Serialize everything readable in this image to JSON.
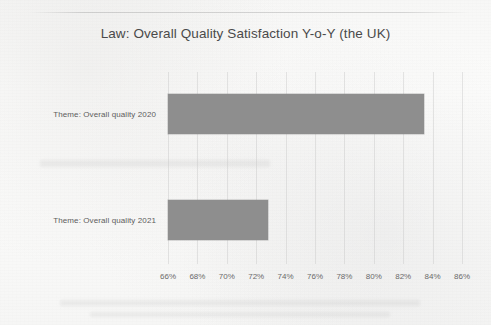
{
  "document": {
    "medium": "scanned-page",
    "background_color": "#fbfbfa"
  },
  "chart_data": {
    "type": "bar",
    "orientation": "horizontal",
    "title": "Law: Overall Quality Satisfaction Y-o-Y (the UK)",
    "xlabel": "",
    "ylabel": "",
    "categories": [
      "Theme: Overall quality 2020",
      "Theme: Overall quality 2021"
    ],
    "values": [
      83.4,
      72.8
    ],
    "value_unit": "%",
    "xlim": [
      66,
      86
    ],
    "xtick_labels": [
      "66%",
      "68%",
      "70%",
      "72%",
      "74%",
      "76%",
      "78%",
      "80%",
      "82%",
      "84%",
      "86%"
    ],
    "xtick_values": [
      66,
      68,
      70,
      72,
      74,
      76,
      78,
      80,
      82,
      84,
      86
    ],
    "grid": true,
    "legend": null,
    "bar_color": "#8e8e8e",
    "series": [
      {
        "name": "Overall quality satisfaction",
        "values": [
          83.4,
          72.8
        ]
      }
    ]
  }
}
